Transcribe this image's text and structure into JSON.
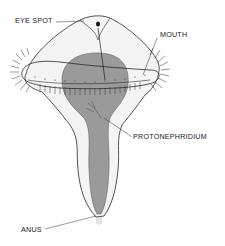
{
  "diagram": {
    "type": "anatomical-illustration",
    "colors": {
      "outline": "#2a2a2a",
      "body_fill": "#f4f4f4",
      "gut_fill": "#9a9a9a",
      "cilia": "#333333",
      "background": "#ffffff"
    },
    "labels": [
      {
        "id": "eye-spot",
        "text": "EYE SPOT"
      },
      {
        "id": "mouth",
        "text": "MOUTH"
      },
      {
        "id": "protonephridium",
        "text": "PROTONEPHRIDIUM"
      },
      {
        "id": "anus",
        "text": "ANUS"
      }
    ]
  }
}
